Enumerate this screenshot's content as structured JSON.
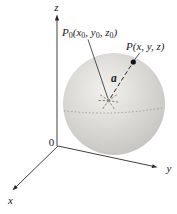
{
  "colors": {
    "background": "#ffffff",
    "sphere_highlight": "#f2f1ee",
    "sphere_mid": "#dedcd8",
    "sphere_edge": "#c5c3bf",
    "equator": "#9b9992",
    "ink": "#2a2a26",
    "point_dot": "#111111",
    "center_marker": "#7b7971",
    "center_blob": "#8f8d85"
  },
  "axes": {
    "z_label": "z",
    "y_label": "y",
    "x_label": "x",
    "origin_label": "0"
  },
  "labels": {
    "center_point": {
      "parts": [
        {
          "t": "P",
          "sub": false
        },
        {
          "t": "0",
          "sub": true
        },
        {
          "t": "(x",
          "sub": false
        },
        {
          "t": "0",
          "sub": true
        },
        {
          "t": ", y",
          "sub": false
        },
        {
          "t": "0",
          "sub": true
        },
        {
          "t": ", z",
          "sub": false
        },
        {
          "t": "0",
          "sub": true
        },
        {
          "t": ")",
          "sub": false
        }
      ]
    },
    "surface_point": "P(x, y, z)",
    "radius": "a"
  }
}
